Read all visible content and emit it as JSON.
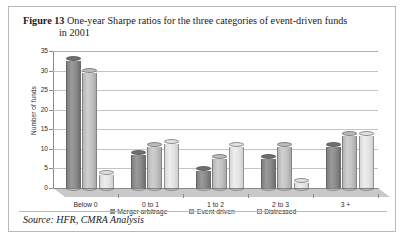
{
  "figure": {
    "number_label": "Figure 13",
    "caption_line1": "One-year Sharpe ratios for the three categories of event-driven funds",
    "caption_line2": "in 2001",
    "source": "Source: HFR, CMRA Analysis"
  },
  "legend": {
    "position": "bottom-center",
    "items": [
      {
        "label": "Merger arbitrage",
        "color": "#8b8b8b"
      },
      {
        "label": "Event driven",
        "color": "#c2c2c2"
      },
      {
        "label": "Distressed",
        "color": "#e6e6e6"
      }
    ]
  },
  "chart_data": {
    "type": "bar",
    "title": "One-year Sharpe ratios for the three categories of event-driven funds in 2001",
    "xlabel": "",
    "ylabel": "Number of funds",
    "ylim": [
      0,
      35
    ],
    "yticks": [
      0,
      5,
      10,
      15,
      20,
      25,
      30,
      35
    ],
    "grid": true,
    "categories": [
      "Below 0",
      "0 to 1",
      "1 to 2",
      "2 to 3",
      "3 +"
    ],
    "series": [
      {
        "name": "Merger arbitrage",
        "color": "#8b8b8b",
        "values": [
          33,
          9,
          5,
          8,
          11
        ]
      },
      {
        "name": "Event driven",
        "color": "#c2c2c2",
        "values": [
          30,
          11,
          8,
          11,
          14
        ]
      },
      {
        "name": "Distressed",
        "color": "#e6e6e6",
        "values": [
          4,
          12,
          11,
          2,
          14
        ]
      }
    ]
  }
}
